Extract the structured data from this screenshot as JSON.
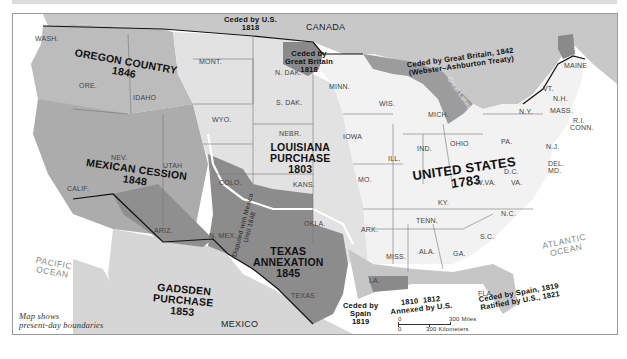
{
  "map": {
    "caption_line1": "Map shows",
    "caption_line2": "present-day boundaries",
    "countries": {
      "canada": "CANADA",
      "mexico": "MEXICO"
    },
    "oceans": {
      "pacific_1": "PACIFIC",
      "pacific_2": "OCEAN",
      "atlantic_1": "ATLANTIC",
      "atlantic_2": "OCEAN"
    },
    "regions": {
      "oregon": {
        "name": "OREGON COUNTRY",
        "year": "1846"
      },
      "mexican_cession": {
        "name": "MEXICAN CESSION",
        "year": "1848"
      },
      "louisiana": {
        "name_1": "LOUISIANA",
        "name_2": "PURCHASE",
        "year": "1803"
      },
      "texas": {
        "name": "TEXAS",
        "name_2": "ANNEXATION",
        "year": "1845"
      },
      "gadsden": {
        "name_1": "GADSDEN",
        "name_2": "PURCHASE",
        "year": "1853"
      },
      "united_states": {
        "name": "UNITED STATES",
        "year": "1783"
      }
    },
    "annotations": {
      "ceded_us_1818": {
        "l1": "Ceded by U.S.",
        "l2": "1818"
      },
      "ceded_gb_1818": {
        "l1": "Ceded by",
        "l2": "Great Britain",
        "l3": "1818"
      },
      "ceded_gb_1842": {
        "l1": "Ceded by Great Britain, 1842",
        "l2": "(Webster–Ashburton Treaty)"
      },
      "disputed": {
        "l1": "Disputed with Mexico",
        "l2": "Until 1848"
      },
      "ceded_spain_1819": {
        "l1": "Ceded by",
        "l2": "Spain",
        "l3": "1819"
      },
      "annexed": {
        "y1": "1810",
        "y2": "1812",
        "l2": "Annexed by U.S."
      },
      "florida": {
        "l1": "Ceded by Spain, 1819",
        "l2": "Ratified by U.S., 1821"
      },
      "great_lakes": "Great Lakes"
    },
    "states": [
      {
        "key": "wash",
        "label": "WASH.",
        "x": 22,
        "y": 21
      },
      {
        "key": "ore",
        "label": "ORE.",
        "x": 66,
        "y": 68
      },
      {
        "key": "idaho",
        "label": "IDAHO",
        "x": 120,
        "y": 80
      },
      {
        "key": "mont",
        "label": "MONT.",
        "x": 186,
        "y": 44
      },
      {
        "key": "wyo",
        "label": "WYO.",
        "x": 199,
        "y": 102
      },
      {
        "key": "ndak",
        "label": "N. DAK.",
        "x": 262,
        "y": 55
      },
      {
        "key": "sdak",
        "label": "S. DAK.",
        "x": 263,
        "y": 85
      },
      {
        "key": "nebr",
        "label": "NEBR.",
        "x": 266,
        "y": 116
      },
      {
        "key": "kans",
        "label": "KANS.",
        "x": 280,
        "y": 167
      },
      {
        "key": "okla",
        "label": "OKLA.",
        "x": 291,
        "y": 206
      },
      {
        "key": "minn",
        "label": "MINN.",
        "x": 316,
        "y": 69
      },
      {
        "key": "iowa",
        "label": "IOWA",
        "x": 330,
        "y": 119
      },
      {
        "key": "mo",
        "label": "MO.",
        "x": 345,
        "y": 162
      },
      {
        "key": "ark",
        "label": "ARK.",
        "x": 348,
        "y": 212
      },
      {
        "key": "la",
        "label": "LA.",
        "x": 356,
        "y": 263
      },
      {
        "key": "wis",
        "label": "WIS.",
        "x": 366,
        "y": 86
      },
      {
        "key": "ill",
        "label": "ILL.",
        "x": 375,
        "y": 141
      },
      {
        "key": "mich",
        "label": "MICH.",
        "x": 415,
        "y": 97
      },
      {
        "key": "ind",
        "label": "IND.",
        "x": 404,
        "y": 131
      },
      {
        "key": "ohio",
        "label": "OHIO",
        "x": 437,
        "y": 126
      },
      {
        "key": "ky",
        "label": "KY.",
        "x": 425,
        "y": 185
      },
      {
        "key": "tenn",
        "label": "TENN.",
        "x": 403,
        "y": 203
      },
      {
        "key": "miss",
        "label": "MISS.",
        "x": 373,
        "y": 239
      },
      {
        "key": "ala",
        "label": "ALA.",
        "x": 406,
        "y": 234
      },
      {
        "key": "ga",
        "label": "GA.",
        "x": 440,
        "y": 236
      },
      {
        "key": "fla",
        "label": "FLA.",
        "x": 465,
        "y": 276
      },
      {
        "key": "sc",
        "label": "S.C.",
        "x": 467,
        "y": 219
      },
      {
        "key": "nc",
        "label": "N.C.",
        "x": 488,
        "y": 196
      },
      {
        "key": "va",
        "label": "VA.",
        "x": 498,
        "y": 165
      },
      {
        "key": "wva",
        "label": "W.VA.",
        "x": 463,
        "y": 165
      },
      {
        "key": "dc",
        "label": "D.C.",
        "x": 491,
        "y": 154
      },
      {
        "key": "pa",
        "label": "PA.",
        "x": 488,
        "y": 124
      },
      {
        "key": "ny",
        "label": "N.Y.",
        "x": 506,
        "y": 94
      },
      {
        "key": "nj",
        "label": "N.J.",
        "x": 533,
        "y": 129
      },
      {
        "key": "del",
        "label": "DEL.",
        "x": 535,
        "y": 146
      },
      {
        "key": "md",
        "label": "MD.",
        "x": 535,
        "y": 153
      },
      {
        "key": "vt",
        "label": "VT.",
        "x": 530,
        "y": 71
      },
      {
        "key": "nh",
        "label": "N.H.",
        "x": 540,
        "y": 81
      },
      {
        "key": "mass",
        "label": "MASS.",
        "x": 537,
        "y": 93
      },
      {
        "key": "ri",
        "label": "R.I.",
        "x": 560,
        "y": 103
      },
      {
        "key": "conn",
        "label": "CONN.",
        "x": 557,
        "y": 110
      },
      {
        "key": "maine",
        "label": "MAINE",
        "x": 551,
        "y": 48
      },
      {
        "key": "nev",
        "label": "NEV.",
        "x": 98,
        "y": 140
      },
      {
        "key": "utah",
        "label": "UTAH",
        "x": 150,
        "y": 148
      },
      {
        "key": "colo",
        "label": "COLO.",
        "x": 206,
        "y": 165
      },
      {
        "key": "calif",
        "label": "CALIF.",
        "x": 54,
        "y": 171
      },
      {
        "key": "ariz",
        "label": "ARIZ.",
        "x": 141,
        "y": 213
      },
      {
        "key": "nmex",
        "label": "N. MEX.",
        "x": 196,
        "y": 218
      },
      {
        "key": "texas",
        "label": "TEXAS",
        "x": 278,
        "y": 278
      }
    ],
    "scale": {
      "zero": "0",
      "miles": "300 Miles",
      "km": "300 Kilometers"
    },
    "colors": {
      "united_states": "#f2f2f2",
      "louisiana": "#e2e2e2",
      "oregon": "#bcbcbc",
      "mexican_cession": "#acacac",
      "texas": "#8c8c8c",
      "gadsden": "#8f8f8f",
      "ceded_gb_1818": "#8a8a8a",
      "spain_1819": "#c6c6c6",
      "canada": "#c8c8c8",
      "mexico": "#d6d6d6",
      "water": "#ffffff",
      "great_lakes": "#9c9c9c"
    }
  }
}
